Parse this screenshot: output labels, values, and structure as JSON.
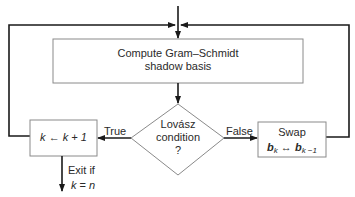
{
  "diagram": {
    "type": "flowchart",
    "colors": {
      "line": "#1a1a1a",
      "box_border": "#8a8a8a",
      "text": "#2a2a2a",
      "background": "#ffffff"
    },
    "nodes": {
      "gram_schmidt": {
        "line1": "Compute Gram–Schmidt",
        "line2": "shadow basis"
      },
      "lovasz": {
        "line1": "Lovász",
        "line2": "condition",
        "line3": "?"
      },
      "increment": {
        "var": "k",
        "arrow": "←",
        "expr": "k + 1"
      },
      "swap": {
        "line1": "Swap",
        "b": "b",
        "k": "k",
        "arrow": "↔",
        "km1": "k −1"
      }
    },
    "edges": {
      "true_label": "True",
      "false_label": "False",
      "exit": {
        "line1": "Exit if",
        "var": "k",
        "op": "= ",
        "val": "n"
      }
    }
  }
}
